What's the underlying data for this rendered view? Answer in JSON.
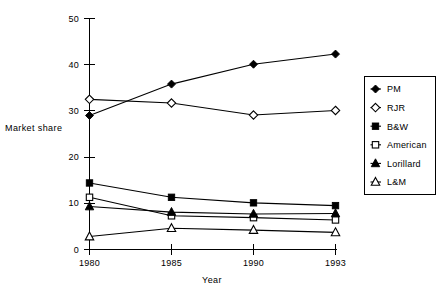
{
  "chart_data": {
    "type": "line",
    "title": "",
    "xlabel": "Year",
    "ylabel": "Market share",
    "categories": [
      "1980",
      "1985",
      "1990",
      "1993"
    ],
    "x": [
      1980,
      1985,
      1990,
      1993
    ],
    "xlim": [
      1980,
      1993
    ],
    "ylim": [
      0,
      50
    ],
    "yticks": [
      0,
      10,
      20,
      30,
      40,
      50
    ],
    "ytick_labels": [
      "0",
      "10",
      "20",
      "30",
      "40",
      "50"
    ],
    "xtick_labels": [
      "1980",
      "1985",
      "1990",
      "1993"
    ],
    "grid": false,
    "legend_position": "right",
    "axis_style": "categorical-evenly-spaced",
    "colors": {
      "ink": "#000000",
      "background": "#ffffff"
    },
    "series": [
      {
        "name": "PM",
        "marker": "filled-diamond",
        "values": [
          29.0,
          35.8,
          40.1,
          42.3
        ]
      },
      {
        "name": "RJR",
        "marker": "open-diamond",
        "values": [
          32.5,
          31.7,
          29.1,
          30.1
        ]
      },
      {
        "name": "B&W",
        "marker": "filled-square",
        "values": [
          14.4,
          11.3,
          10.1,
          9.5
        ]
      },
      {
        "name": "American",
        "marker": "open-square",
        "values": [
          11.3,
          7.3,
          6.9,
          6.4
        ]
      },
      {
        "name": "Lorillard",
        "marker": "filled-triangle",
        "values": [
          9.3,
          8.1,
          7.7,
          7.8
        ]
      },
      {
        "name": "L&M",
        "marker": "open-triangle",
        "values": [
          2.8,
          4.6,
          4.2,
          3.7
        ]
      }
    ]
  },
  "axes": {
    "y_title": "Market share",
    "x_title": "Year"
  },
  "legend": {
    "entries": [
      {
        "label": "PM",
        "marker": "filled-diamond-icon"
      },
      {
        "label": "RJR",
        "marker": "open-diamond-icon"
      },
      {
        "label": "B&W",
        "marker": "filled-square-icon"
      },
      {
        "label": "American",
        "marker": "open-square-icon"
      },
      {
        "label": "Lorillard",
        "marker": "filled-triangle-icon"
      },
      {
        "label": "L&M",
        "marker": "open-triangle-icon"
      }
    ]
  }
}
